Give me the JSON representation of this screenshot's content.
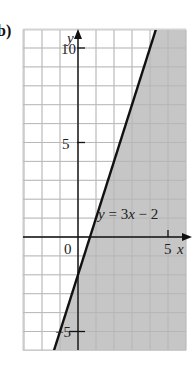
{
  "part_label": "b)",
  "chart_data": {
    "type": "line",
    "title": "",
    "xlabel": "x",
    "ylabel": "y",
    "xlim": [
      -3,
      6
    ],
    "ylim": [
      -6,
      11
    ],
    "x_ticks": [
      {
        "value": 0,
        "label": "0"
      },
      {
        "value": 5,
        "label": "5"
      }
    ],
    "y_ticks": [
      {
        "value": 10,
        "label": "10"
      },
      {
        "value": 5,
        "label": "5"
      },
      {
        "value": -5,
        "label": "-5"
      }
    ],
    "grid": true,
    "series": [
      {
        "name": "y = 3x - 2",
        "equation": "y = 3x - 2",
        "slope": 3,
        "intercept": -2,
        "x": [
          -1.33,
          4.33
        ],
        "y": [
          -6,
          11
        ],
        "style": "solid"
      }
    ],
    "shaded_region": {
      "description": "region to the right of (below) the line",
      "inequality": "y < 3x - 2",
      "color": "#c8c8c8"
    },
    "annotations": [
      {
        "text": "y = 3x − 2",
        "x": 0.9,
        "y": 1.6
      }
    ]
  },
  "labels": {
    "equation": "y = 3x − 2",
    "x_axis": "x",
    "y_axis": "y",
    "origin": "0",
    "x_tick_5": "5",
    "y_tick_10": "10",
    "y_tick_5": "5",
    "y_tick_neg5": "−5"
  },
  "colors": {
    "grid": "#c9c9c9",
    "axis": "#111111",
    "line": "#111111",
    "shade": "#c6c6c6"
  }
}
